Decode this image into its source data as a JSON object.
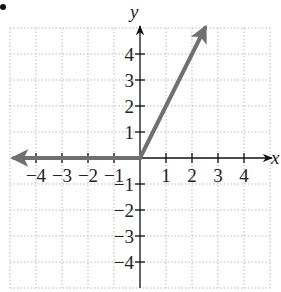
{
  "chart_data": {
    "type": "line",
    "title": "",
    "xlabel": "x",
    "ylabel": "y",
    "xlim": [
      -5,
      5
    ],
    "ylim": [
      -5,
      5
    ],
    "grid": true,
    "xticks": [
      "-4",
      "-3",
      "-2",
      "-1",
      "1",
      "2",
      "3",
      "4"
    ],
    "yticks": [
      "4",
      "3",
      "2",
      "1",
      "-1",
      "-2",
      "-3",
      "-4"
    ],
    "series": [
      {
        "name": "piecewise f(x)",
        "description": "f(x) = 0 for x < 0, f(x) = 2x for x >= 0",
        "segments": [
          {
            "from": [
              -5,
              0
            ],
            "to": [
              0,
              0
            ],
            "arrow_at": "start"
          },
          {
            "from": [
              0,
              0
            ],
            "to": [
              2.5,
              5
            ],
            "arrow_at": "end"
          }
        ]
      }
    ],
    "colors": {
      "graph_line": "#707070",
      "axes": "#111111",
      "grid": "#bbbbbb"
    }
  }
}
